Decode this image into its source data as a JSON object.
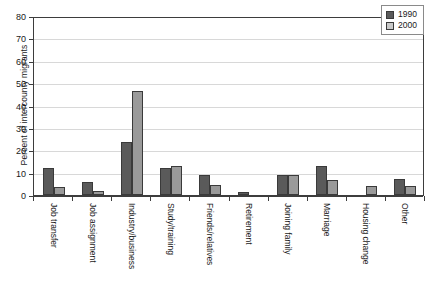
{
  "chart_data": {
    "type": "bar",
    "title": "",
    "xlabel": "",
    "ylabel": "Percent of intercounty migrants",
    "ylim": [
      0,
      80
    ],
    "ytick_labels": [
      "80",
      "70",
      "60",
      "50",
      "40",
      "30",
      "20",
      "10",
      "0"
    ],
    "ytick_values": [
      80,
      70,
      60,
      50,
      40,
      30,
      20,
      10,
      0
    ],
    "grid": "horizontal",
    "legend_position": "top-right",
    "categories": [
      "Job transfer",
      "Job assignment",
      "Industry/business",
      "Study/training",
      "Friends/relatives",
      "Retirement",
      "Joining family",
      "Marriage",
      "Housing change",
      "Other"
    ],
    "series": [
      {
        "name": "1990",
        "color": "#5a5a5a",
        "values": [
          12,
          6,
          23.5,
          12,
          9,
          1.5,
          9,
          13,
          0,
          7
        ]
      },
      {
        "name": "2000",
        "color": "#9a9a9a",
        "values": [
          3.5,
          2,
          46.5,
          13,
          4.5,
          0,
          9,
          6.5,
          4,
          4
        ]
      }
    ]
  },
  "legend": {
    "entries": [
      {
        "label": "1990"
      },
      {
        "label": "2000"
      }
    ]
  }
}
